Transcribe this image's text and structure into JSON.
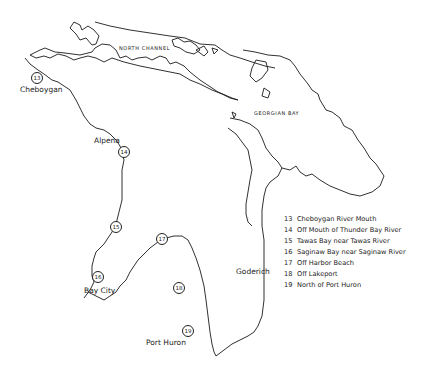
{
  "map": {
    "water_labels": {
      "north_channel": "NORTH CHANNEL",
      "georgian_bay": "GEORGIAN BAY"
    },
    "city_labels": {
      "cheboygan": "Cheboygan",
      "alpena": "Alpena",
      "bay_city": "Bay City",
      "goderich": "Goderich",
      "port_huron": "Port Huron"
    },
    "stations": [
      {
        "number": "13",
        "name": "Cheboygan River Mouth"
      },
      {
        "number": "14",
        "name": "Off Mouth of Thunder Bay River"
      },
      {
        "number": "15",
        "name": "Tawas Bay near Tawas River"
      },
      {
        "number": "16",
        "name": "Saginaw Bay near Saginaw River"
      },
      {
        "number": "17",
        "name": "Off Harbor Beach"
      },
      {
        "number": "18",
        "name": "Off Lakeport"
      },
      {
        "number": "19",
        "name": "North of Port Huron"
      }
    ],
    "line_color": "#1a1a1a",
    "background_color": "#ffffff"
  }
}
